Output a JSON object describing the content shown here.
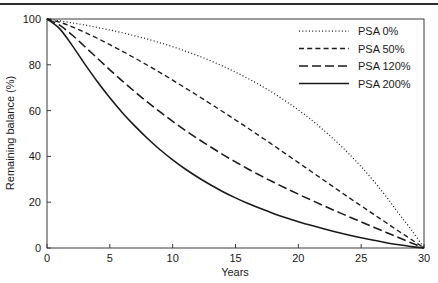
{
  "figure": {
    "background_color": "#ffffff",
    "line_color": "#1a1a1a",
    "frame_color": "#3a3a3a",
    "top_rule": true
  },
  "chart_data": {
    "type": "line",
    "title": "",
    "xlabel": "Years",
    "ylabel": "Remaining balance (%)",
    "xlim": [
      0,
      30
    ],
    "ylim": [
      0,
      100
    ],
    "xticks": [
      0,
      5,
      10,
      15,
      20,
      25,
      30
    ],
    "yticks": [
      0,
      20,
      40,
      60,
      80,
      100
    ],
    "xtick_labels": [
      "0",
      "5",
      "10",
      "15",
      "20",
      "25",
      "30"
    ],
    "ytick_labels": [
      "0",
      "20",
      "40",
      "60",
      "80",
      "100"
    ],
    "grid": false,
    "legend_position": "top-right",
    "x": [
      0,
      1,
      2,
      3,
      4,
      5,
      6,
      7,
      8,
      9,
      10,
      11,
      12,
      13,
      14,
      15,
      16,
      17,
      18,
      19,
      20,
      21,
      22,
      23,
      24,
      25,
      26,
      27,
      28,
      29,
      30
    ],
    "series": [
      {
        "name": "PSA   0%",
        "psa": 0,
        "style": "dotted",
        "values": [
          100.0,
          99.2,
          98.3,
          97.4,
          96.3,
          95.2,
          94.0,
          92.6,
          91.2,
          89.6,
          87.9,
          86.0,
          84.0,
          81.8,
          79.4,
          76.8,
          74.0,
          71.0,
          67.7,
          64.1,
          60.3,
          56.1,
          51.5,
          46.6,
          41.3,
          35.5,
          29.2,
          22.4,
          15.0,
          7.9,
          0.0
        ]
      },
      {
        "name": "PSA  50%",
        "psa": 50,
        "style": "dashed-short",
        "values": [
          100.0,
          98.6,
          96.6,
          94.2,
          91.6,
          88.8,
          85.9,
          82.9,
          79.8,
          76.6,
          73.3,
          69.9,
          66.5,
          63.0,
          59.5,
          55.9,
          52.3,
          48.6,
          44.9,
          41.1,
          37.3,
          33.5,
          29.7,
          25.9,
          22.1,
          18.4,
          14.7,
          11.0,
          7.3,
          3.7,
          0.0
        ]
      },
      {
        "name": "PSA 120%",
        "psa": 120,
        "style": "dashed-long",
        "values": [
          100.0,
          97.3,
          93.0,
          88.0,
          82.9,
          77.8,
          72.9,
          68.2,
          63.7,
          59.4,
          55.3,
          51.4,
          47.7,
          44.2,
          40.8,
          37.6,
          34.5,
          31.6,
          28.8,
          26.1,
          23.5,
          21.0,
          18.5,
          16.1,
          13.7,
          11.4,
          9.1,
          6.8,
          4.5,
          2.2,
          0.0
        ]
      },
      {
        "name": "PSA 200%",
        "psa": 200,
        "style": "solid",
        "values": [
          100.0,
          95.8,
          88.5,
          80.4,
          72.7,
          65.6,
          59.1,
          53.2,
          47.8,
          42.9,
          38.5,
          34.5,
          30.9,
          27.6,
          24.6,
          21.9,
          19.4,
          17.2,
          15.1,
          13.2,
          11.5,
          9.9,
          8.4,
          7.0,
          5.7,
          4.5,
          3.4,
          2.3,
          1.4,
          0.6,
          0.0
        ]
      }
    ]
  },
  "legend": {
    "items": [
      {
        "label": "PSA   0%",
        "style": "dotted"
      },
      {
        "label": "PSA  50%",
        "style": "dashed-short"
      },
      {
        "label": "PSA 120%",
        "style": "dashed-long"
      },
      {
        "label": "PSA 200%",
        "style": "solid"
      }
    ]
  }
}
